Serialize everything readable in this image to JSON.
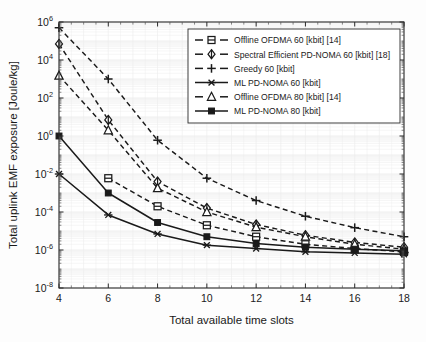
{
  "chart_data": {
    "type": "line",
    "title": "",
    "xlabel": "Total available time slots",
    "ylabel": "Total uplink EMF exposure [Joule/kg]",
    "yscale": "log",
    "xlim": [
      4,
      18
    ],
    "ylim": [
      1e-08,
      1000000.0
    ],
    "xticks": [
      4,
      6,
      8,
      10,
      12,
      14,
      16,
      18
    ],
    "xticklabels": [
      "4",
      "6",
      "8",
      "10",
      "12",
      "14",
      "16",
      "18"
    ],
    "yticks": [
      1000000.0,
      10000.0,
      100.0,
      1.0,
      0.01,
      0.0001,
      1e-06,
      1e-08
    ],
    "yticklabels": [
      "10⁶",
      "10⁴",
      "10²",
      "10⁰",
      "10⁻²",
      "10⁻⁴",
      "10⁻⁶",
      "10⁻⁸"
    ],
    "ytick_mantissa": [
      "10",
      "10",
      "10",
      "10",
      "10",
      "10",
      "10",
      "10"
    ],
    "ytick_exponent": [
      "6",
      "4",
      "2",
      "0",
      "-2",
      "-4",
      "-6",
      "-8"
    ],
    "grid": true,
    "legend_position": "upper right",
    "x": [
      4,
      6,
      8,
      10,
      12,
      14,
      16,
      18
    ],
    "series": [
      {
        "name": "Offline OFDMA 60 [kbit] [14]",
        "marker": "square-open",
        "linestyle": "dashed",
        "color": "#1a1a1a",
        "values": [
          null,
          0.006,
          0.0002,
          2e-05,
          5e-06,
          2e-06,
          1.2e-06,
          8e-07
        ]
      },
      {
        "name": "Spectral Efficient PD-NOMA 60 [kbit] [18]",
        "marker": "diamond-open",
        "linestyle": "dashed",
        "color": "#1a1a1a",
        "values": [
          70000.0,
          7.0,
          0.004,
          0.00016,
          2.2e-05,
          6e-06,
          2.5e-06,
          1.4e-06
        ]
      },
      {
        "name": "Greedy 60 [kbit]",
        "marker": "plus",
        "linestyle": "dashed",
        "color": "#1a1a1a",
        "values": [
          500000.0,
          1000.0,
          0.6,
          0.006,
          0.0004,
          6e-05,
          1.5e-05,
          5e-06
        ]
      },
      {
        "name": "ML PD-NOMA 60 [kbit]",
        "marker": "star",
        "linestyle": "solid",
        "color": "#1a1a1a",
        "values": [
          0.01,
          7e-05,
          7e-06,
          1.8e-06,
          1.2e-06,
          8e-07,
          7e-07,
          6e-07
        ]
      },
      {
        "name": "Offline OFDMA 80 [kbit] [14]",
        "marker": "triangle-open",
        "linestyle": "dashed",
        "color": "#1a1a1a",
        "values": [
          1500.0,
          2.0,
          0.0018,
          0.0001,
          1.6e-05,
          5e-06,
          2e-06,
          1.1e-06
        ]
      },
      {
        "name": "ML PD-NOMA 80 [kbit]",
        "marker": "square-filled",
        "linestyle": "solid",
        "color": "#1a1a1a",
        "values": [
          1.0,
          0.001,
          2.8e-05,
          5e-06,
          2.2e-06,
          1.4e-06,
          1.1e-06,
          9e-07
        ]
      }
    ]
  },
  "legend": {
    "entries": [
      "Offline OFDMA 60 [kbit] [14]",
      "Spectral Efficient PD-NOMA 60 [kbit] [18]",
      "Greedy 60 [kbit]",
      "ML PD-NOMA 60 [kbit]",
      "Offline OFDMA 80 [kbit] [14]",
      "ML PD-NOMA 80 [kbit]"
    ]
  }
}
